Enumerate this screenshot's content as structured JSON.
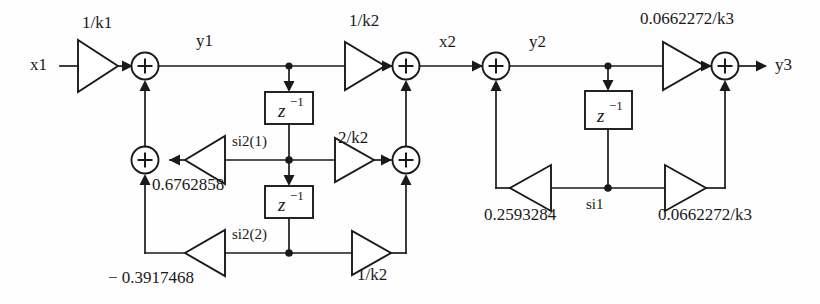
{
  "diagram": {
    "type": "signal-flow-graph",
    "colors": {
      "line": "#1a1a1a",
      "background": "#fefefe",
      "fill": "#ffffff"
    },
    "signals": {
      "input": "x1",
      "y1": "y1",
      "x2": "x2",
      "y2": "y2",
      "output": "y3"
    },
    "state_labels": {
      "si2_1": "si2(1)",
      "si2_2": "si2(2)",
      "si1": "si1"
    },
    "delay_label": {
      "base": "z",
      "exponent": "−1"
    },
    "gains": [
      {
        "id": "gain-1-over-k1",
        "label": "1/k1"
      },
      {
        "id": "gain-1-over-k2-top",
        "label": "1/k2"
      },
      {
        "id": "gain-2-over-k2",
        "label": "2/k2"
      },
      {
        "id": "gain-1-over-k2-bottom",
        "label": "1/k2"
      },
      {
        "id": "gain-0-6762858",
        "label": "0.6762858"
      },
      {
        "id": "gain-neg-0-3917468",
        "label": "− 0.3917468"
      },
      {
        "id": "gain-0-0662272-over-k3-top",
        "label": "0.0662272/k3"
      },
      {
        "id": "gain-0-2593284",
        "label": "0.2593284"
      },
      {
        "id": "gain-0-0662272-over-k3-bottom",
        "label": "0.0662272/k3"
      }
    ],
    "adders": [
      {
        "id": "adder-1",
        "symbol": "+"
      },
      {
        "id": "adder-2",
        "symbol": "+"
      },
      {
        "id": "adder-3",
        "symbol": "+"
      },
      {
        "id": "adder-4",
        "symbol": "+"
      },
      {
        "id": "adder-5",
        "symbol": "+"
      },
      {
        "id": "adder-6",
        "symbol": "+"
      }
    ],
    "delays": [
      {
        "id": "delay-section2-1"
      },
      {
        "id": "delay-section2-2"
      },
      {
        "id": "delay-section1-1"
      }
    ]
  }
}
